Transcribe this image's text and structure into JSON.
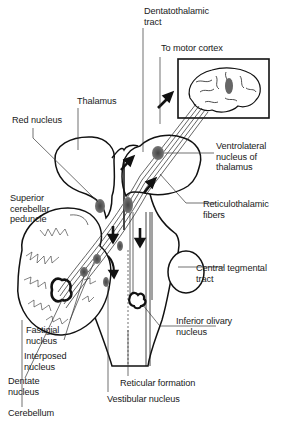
{
  "diagram": {
    "labels": {
      "dentatothalamic_tract": "Dentatothalamic\ntract",
      "to_motor_cortex": "To motor cortex",
      "thalamus": "Thalamus",
      "red_nucleus": "Red nucleus",
      "ventrolateral_nucleus": "Ventrolateral\nnucleus of\nthalamus",
      "superior_cerebellar_peduncle": "Superior\ncerebellar\npeduncle",
      "reticulothalamic_fibers": "Reticulothalamic\nfibers",
      "central_tegmental_tract": "Central tegmental\ntract",
      "inferior_olivary_nucleus": "Inferior olivary\nnucleus",
      "fastigial_nucleus": "Fastigial\nnucleus",
      "interposed_nucleus": "Interposed\nnucleus",
      "dentate_nucleus": "Dentate\nnucleus",
      "cerebellum": "Cerebellum",
      "reticular_formation": "Reticular formation",
      "vestibular_nucleus": "Vestibular nucleus"
    },
    "colors": {
      "line": "#111111",
      "nucleus_fill": "#555555",
      "background": "#ffffff"
    }
  }
}
